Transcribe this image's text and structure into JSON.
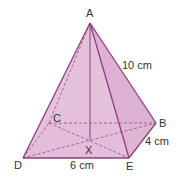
{
  "diagram": {
    "type": "square-based pyramid",
    "vertices": {
      "A": {
        "label": "A",
        "x": 90,
        "y": 23,
        "lx": 86,
        "ly": 17
      },
      "B": {
        "label": "B",
        "x": 156,
        "y": 123,
        "lx": 159,
        "ly": 127
      },
      "C": {
        "label": "C",
        "x": 49,
        "y": 123,
        "lx": 53,
        "ly": 122
      },
      "D": {
        "label": "D",
        "x": 23,
        "y": 158,
        "lx": 14,
        "ly": 169
      },
      "E": {
        "label": "E",
        "x": 129,
        "y": 158,
        "lx": 126,
        "ly": 170
      },
      "X": {
        "label": "X",
        "x": 90,
        "y": 140,
        "lx": 85,
        "ly": 154
      }
    },
    "measurements": [
      {
        "label": "10 cm",
        "edge": "AB",
        "x": 122,
        "y": 69
      },
      {
        "label": "4 cm",
        "edge": "EB",
        "x": 145,
        "y": 145
      },
      {
        "label": "6 cm",
        "edge": "DE",
        "x": 70,
        "y": 169
      }
    ],
    "colors": {
      "edge": "#8e3f7f",
      "fill_front": "#e4bbd8",
      "fill_side": "#dcb0d0",
      "hidden": "#9a5a8c"
    }
  }
}
